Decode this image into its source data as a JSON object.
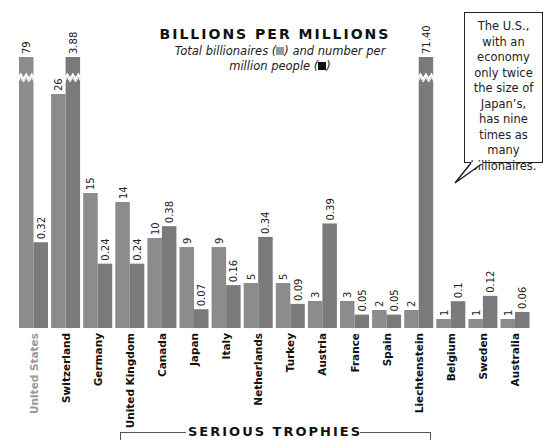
{
  "chart_data": {
    "type": "bar",
    "title": "BILLIONS PER MILLIONS",
    "subtitle": "Total billionaires (■) and number per million people (■)",
    "categories": [
      "United States",
      "Switzerland",
      "Germany",
      "United Kingdom",
      "Canada",
      "Japan",
      "Italy",
      "Netherlands",
      "Turkey",
      "Austria",
      "France",
      "Spain",
      "Liechtenstein",
      "Belgium",
      "Sweden",
      "Australia"
    ],
    "series": [
      {
        "name": "Total billionaires",
        "color": "#8c8c8c",
        "values": [
          79,
          26,
          15,
          14,
          10,
          9,
          9,
          5,
          5,
          3,
          3,
          2,
          2,
          1,
          1,
          1
        ],
        "labels": [
          "79",
          "26",
          "15",
          "14",
          "10",
          "9",
          "9",
          "5",
          "5",
          "3",
          "3",
          "2",
          "2",
          "1",
          "1",
          "1"
        ]
      },
      {
        "name": "Number per million people",
        "color": "#7a7a7a",
        "values": [
          0.32,
          3.88,
          0.24,
          0.24,
          0.38,
          0.07,
          0.16,
          0.34,
          0.09,
          0.39,
          0.05,
          0.05,
          71.4,
          0.1,
          0.12,
          0.06
        ],
        "labels": [
          "0.32",
          "3.88",
          "0.24",
          "0.24",
          "0.38",
          "0.07",
          "0.16",
          "0.34",
          "0.09",
          "0.39",
          "0.05",
          "0.05",
          "71.40",
          "0.1",
          "0.12",
          "0.06"
        ]
      }
    ],
    "truncated": [
      {
        "category": "United States",
        "series": "Total billionaires"
      },
      {
        "category": "Switzerland",
        "series": "Number per million people"
      },
      {
        "category": "Liechtenstein",
        "series": "Number per million people"
      }
    ],
    "highlighted_category": "United States",
    "xlabel": "",
    "ylabel": "",
    "grid": false,
    "legend_position": "subtitle"
  },
  "header": {
    "title": "BILLIONS PER MILLIONS",
    "subtitle_part1": "Total billionaires (",
    "subtitle_part2": ") and number per million people (",
    "subtitle_part3": ")",
    "legend_colors": {
      "total": "#8c8c8c",
      "per_million": "#111111"
    }
  },
  "callout": {
    "text": "The U.S., with an economy only twice the size of Japan’s, has nine times as many billionaires.",
    "lines": [
      "The U.S.,",
      "with an",
      "economy",
      "only twice",
      "the size of",
      "Japan’s,",
      "has nine",
      "times as",
      "many",
      "billionaires."
    ]
  },
  "footer": {
    "section_title": "SERIOUS TROPHIES"
  },
  "colors": {
    "bar_total": "#8c8c8c",
    "bar_per_million": "#7a7a7a",
    "label_highlight": "#9a9a9a",
    "label_default": "#111111"
  }
}
